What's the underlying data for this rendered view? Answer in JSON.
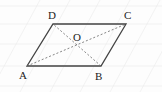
{
  "diagram": {
    "type": "parallelogram",
    "vertices": {
      "A": {
        "label": "A",
        "x": 27,
        "y": 66
      },
      "B": {
        "label": "B",
        "x": 101,
        "y": 66
      },
      "C": {
        "label": "C",
        "x": 126,
        "y": 24
      },
      "D": {
        "label": "D",
        "x": 53,
        "y": 24
      }
    },
    "center": {
      "label": "O",
      "x": 77,
      "y": 45
    },
    "sides": [
      "AB",
      "BC",
      "CD",
      "DA"
    ],
    "diagonals": [
      "AC",
      "BD"
    ],
    "colors": {
      "edge": "#444444",
      "diagonal": "#666666",
      "grid": "#e8e8e8"
    }
  }
}
